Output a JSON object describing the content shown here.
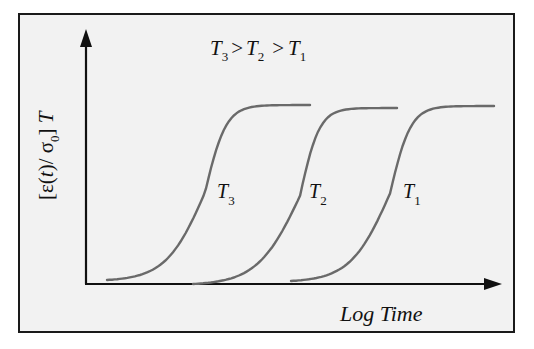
{
  "chart_data": {
    "type": "line",
    "title_parts": [
      {
        "symbol": "T",
        "sub": "3"
      },
      {
        "op": ">"
      },
      {
        "symbol": "T",
        "sub": "2"
      },
      {
        "op": ">"
      },
      {
        "symbol": "T",
        "sub": "1"
      }
    ],
    "xlabel": "Log Time",
    "ylabel": "[ε(t)/ σ0] T",
    "ylabel_parts": {
      "open": "[ε(",
      "t": "t",
      "mid": ")/ σ",
      "sub": "0",
      "close": "] ",
      "T": "T"
    },
    "axes": {
      "ticks": false,
      "grid": false,
      "arrows": true
    },
    "curve_shape": "sigmoid",
    "series": [
      {
        "name": "T3",
        "label": {
          "symbol": "T",
          "sub": "3"
        },
        "start": [
          107,
          280
        ],
        "midpoint": [
          205,
          190
        ],
        "plateau_y": 105,
        "end_x": 310
      },
      {
        "name": "T2",
        "label": {
          "symbol": "T",
          "sub": "2"
        },
        "start": [
          193,
          284
        ],
        "midpoint": [
          300,
          190
        ],
        "plateau_y": 108,
        "end_x": 397
      },
      {
        "name": "T1",
        "label": {
          "symbol": "T",
          "sub": "1"
        },
        "start": [
          291,
          281
        ],
        "midpoint": [
          390,
          190
        ],
        "plateau_y": 106,
        "end_x": 494
      }
    ],
    "annotation": "Curves shift to shorter log time as temperature increases"
  },
  "colors": {
    "frame": "#1a1a1a",
    "background": "#f2f2f2",
    "axis": "#111111",
    "curve": "#6a6a6a",
    "text": "#111111"
  }
}
